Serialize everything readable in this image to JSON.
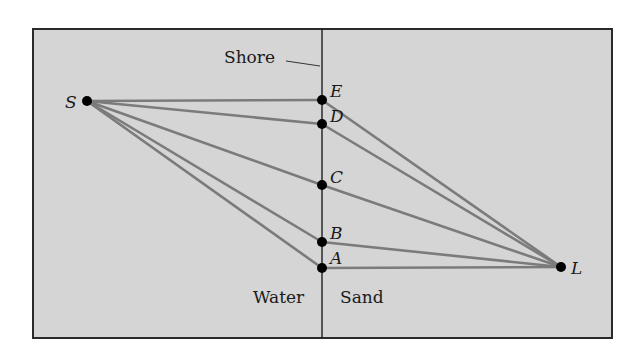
{
  "figure": {
    "frame": {
      "x": 33,
      "y": 29,
      "width": 579,
      "height": 309
    },
    "shore_x": 322,
    "labels": {
      "shore": "Shore",
      "water": "Water",
      "sand": "Sand"
    },
    "points": {
      "S": {
        "label": "S",
        "x": 87,
        "y": 101
      },
      "E": {
        "label": "E",
        "x": 322,
        "y": 100
      },
      "D": {
        "label": "D",
        "x": 322,
        "y": 124
      },
      "C": {
        "label": "C",
        "x": 322,
        "y": 185
      },
      "B": {
        "label": "B",
        "x": 322,
        "y": 242
      },
      "A": {
        "label": "A",
        "x": 322,
        "y": 268
      },
      "L": {
        "label": "L",
        "x": 561,
        "y": 267
      }
    },
    "paths": [
      {
        "name": "path-via-E",
        "through": "E"
      },
      {
        "name": "path-via-D",
        "through": "D"
      },
      {
        "name": "path-via-C",
        "through": "C"
      },
      {
        "name": "path-via-B",
        "through": "B"
      },
      {
        "name": "path-via-A",
        "through": "A"
      }
    ],
    "colors": {
      "background": "#d5d5d5",
      "ray": "#7b7b7b",
      "border": "#2a2a2a",
      "point": "#000000"
    }
  }
}
